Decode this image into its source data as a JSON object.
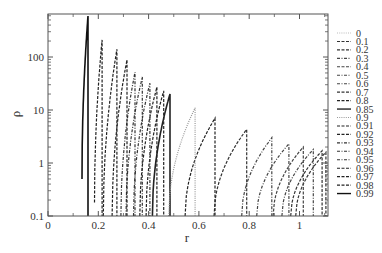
{
  "chart_data": {
    "type": "line",
    "title": "",
    "xlabel": "r",
    "ylabel": "ρ",
    "xlim": [
      0,
      1.1
    ],
    "ylim": [
      0.1,
      650
    ],
    "yscale": "log",
    "grid": false,
    "legend_position": "right",
    "x_ticks": [
      "0",
      "0.2",
      "0.4",
      "0.6",
      "0.8",
      "1"
    ],
    "y_ticks": [
      "0.1",
      "1",
      "10",
      "100"
    ],
    "series": [
      {
        "name": "0",
        "style": "dotted",
        "color": "#bbbbbb",
        "start_r": 1.12,
        "peak_r": 1.14,
        "peak_rho": 1.2,
        "start_rho": 0.1
      },
      {
        "name": "0.1",
        "style": "dashed",
        "color": "#333333",
        "start_r": 0.985,
        "peak_r": 1.105,
        "peak_rho": 1.6,
        "start_rho": 0.1
      },
      {
        "name": "0.2",
        "style": "dashed",
        "color": "#333333",
        "start_r": 0.965,
        "peak_r": 1.09,
        "peak_rho": 1.7,
        "start_rho": 0.1
      },
      {
        "name": "0.3",
        "style": "dashdot",
        "color": "#444444",
        "start_r": 0.93,
        "peak_r": 1.055,
        "peak_rho": 1.8,
        "start_rho": 0.1
      },
      {
        "name": "0.4",
        "style": "dashed",
        "color": "#444444",
        "start_r": 0.895,
        "peak_r": 1.015,
        "peak_rho": 2.0,
        "start_rho": 0.1
      },
      {
        "name": "0.5",
        "style": "dashdot",
        "color": "#444444",
        "start_r": 0.83,
        "peak_r": 0.958,
        "peak_rho": 2.3,
        "start_rho": 0.1
      },
      {
        "name": "0.6",
        "style": "dashdot",
        "color": "#444444",
        "start_r": 0.77,
        "peak_r": 0.89,
        "peak_rho": 3.0,
        "start_rho": 0.1
      },
      {
        "name": "0.7",
        "style": "dashed",
        "color": "#333333",
        "start_r": 0.66,
        "peak_r": 0.79,
        "peak_rho": 4.3,
        "start_rho": 0.1
      },
      {
        "name": "0.8",
        "style": "dashed",
        "color": "#222222",
        "start_r": 0.545,
        "peak_r": 0.664,
        "peak_rho": 7.0,
        "start_rho": 0.1
      },
      {
        "name": "0.85",
        "style": "solid",
        "color": "#222222",
        "start_r": 0.415,
        "peak_r": 0.485,
        "peak_rho": 20,
        "start_rho": 0.1
      },
      {
        "name": "0.9",
        "style": "dotted",
        "color": "#999999",
        "start_r": 0.48,
        "peak_r": 0.585,
        "peak_rho": 11,
        "start_rho": 0.1
      },
      {
        "name": "0.91",
        "style": "dashed",
        "color": "#222222",
        "start_r": 0.39,
        "peak_r": 0.46,
        "peak_rho": 23,
        "start_rho": 0.1
      },
      {
        "name": "0.92",
        "style": "dashed",
        "color": "#222222",
        "start_r": 0.365,
        "peak_r": 0.433,
        "peak_rho": 27,
        "start_rho": 0.1
      },
      {
        "name": "0.93",
        "style": "dashdot",
        "color": "#333333",
        "start_r": 0.34,
        "peak_r": 0.405,
        "peak_rho": 32,
        "start_rho": 0.1
      },
      {
        "name": "0.94",
        "style": "dashdot",
        "color": "#333333",
        "start_r": 0.31,
        "peak_r": 0.375,
        "peak_rho": 42,
        "start_rho": 0.1
      },
      {
        "name": "0.95",
        "style": "dashdot",
        "color": "#333333",
        "start_r": 0.29,
        "peak_r": 0.346,
        "peak_rho": 52,
        "start_rho": 0.1
      },
      {
        "name": "0.96",
        "style": "dashed",
        "color": "#222222",
        "start_r": 0.255,
        "peak_r": 0.314,
        "peak_rho": 88,
        "start_rho": 0.1
      },
      {
        "name": "0.97",
        "style": "dashed",
        "color": "#222222",
        "start_r": 0.22,
        "peak_r": 0.274,
        "peak_rho": 140,
        "start_rho": 0.1
      },
      {
        "name": "0.98",
        "style": "dashed",
        "color": "#222222",
        "start_r": 0.185,
        "peak_r": 0.215,
        "peak_rho": 210,
        "start_rho": 0.18
      },
      {
        "name": "0.99",
        "style": "solid",
        "color": "#111111",
        "start_r": 0.135,
        "peak_r": 0.159,
        "peak_rho": 590,
        "start_rho": 0.5
      }
    ]
  }
}
